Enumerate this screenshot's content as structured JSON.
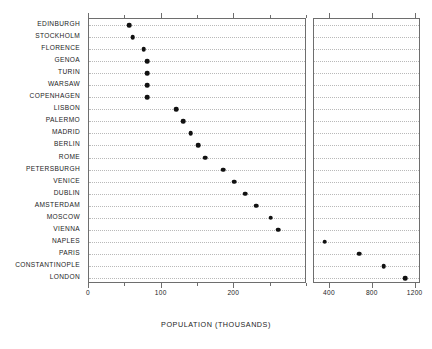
{
  "chart_data": {
    "type": "scatter",
    "title": "",
    "xlabel": "POPULATION (THOUSANDS)",
    "ylabel": "",
    "orientation": "horizontal",
    "grid": true,
    "legend": null,
    "panels": [
      {
        "name": "left-panel",
        "xlim": [
          0,
          300
        ],
        "xticks": [
          0,
          100,
          200
        ],
        "xtick_labels": [
          "0",
          "100",
          "200"
        ],
        "minor_tick_step": 50
      },
      {
        "name": "right-panel",
        "xlim": [
          250,
          1250
        ],
        "xticks": [
          400,
          800,
          1200
        ],
        "xtick_labels": [
          "400",
          "800",
          "1200"
        ],
        "minor_tick_step": 0
      }
    ],
    "categories": [
      "EDINBURGH",
      "STOCKHOLM",
      "FLORENCE",
      "GENOA",
      "TURIN",
      "WARSAW",
      "COPENHAGEN",
      "LISBON",
      "PALERMO",
      "MADRID",
      "BERLIN",
      "ROME",
      "PETERSBURGH",
      "VENICE",
      "DUBLIN",
      "AMSTERDAM",
      "MOSCOW",
      "VIENNA",
      "NAPLES",
      "PARIS",
      "CONSTANTINOPLE",
      "LONDON"
    ],
    "values": [
      55,
      60,
      75,
      80,
      80,
      80,
      80,
      120,
      130,
      140,
      150,
      160,
      185,
      200,
      215,
      230,
      250,
      260,
      350,
      670,
      900,
      1100
    ],
    "points": [
      {
        "label": "EDINBURGH",
        "value": 55,
        "panel": 0
      },
      {
        "label": "STOCKHOLM",
        "value": 60,
        "panel": 0
      },
      {
        "label": "FLORENCE",
        "value": 75,
        "panel": 0
      },
      {
        "label": "GENOA",
        "value": 80,
        "panel": 0
      },
      {
        "label": "TURIN",
        "value": 80,
        "panel": 0
      },
      {
        "label": "WARSAW",
        "value": 80,
        "panel": 0
      },
      {
        "label": "COPENHAGEN",
        "value": 80,
        "panel": 0
      },
      {
        "label": "LISBON",
        "value": 120,
        "panel": 0
      },
      {
        "label": "PALERMO",
        "value": 130,
        "panel": 0
      },
      {
        "label": "MADRID",
        "value": 140,
        "panel": 0
      },
      {
        "label": "BERLIN",
        "value": 150,
        "panel": 0
      },
      {
        "label": "ROME",
        "value": 160,
        "panel": 0
      },
      {
        "label": "PETERSBURGH",
        "value": 185,
        "panel": 0
      },
      {
        "label": "VENICE",
        "value": 200,
        "panel": 0
      },
      {
        "label": "DUBLIN",
        "value": 215,
        "panel": 0
      },
      {
        "label": "AMSTERDAM",
        "value": 230,
        "panel": 0
      },
      {
        "label": "MOSCOW",
        "value": 250,
        "panel": 0
      },
      {
        "label": "VIENNA",
        "value": 260,
        "panel": 0
      },
      {
        "label": "NAPLES",
        "value": 350,
        "panel": 1
      },
      {
        "label": "PARIS",
        "value": 670,
        "panel": 1
      },
      {
        "label": "CONSTANTINOPLE",
        "value": 900,
        "panel": 1
      },
      {
        "label": "LONDON",
        "value": 1100,
        "panel": 1
      }
    ]
  }
}
